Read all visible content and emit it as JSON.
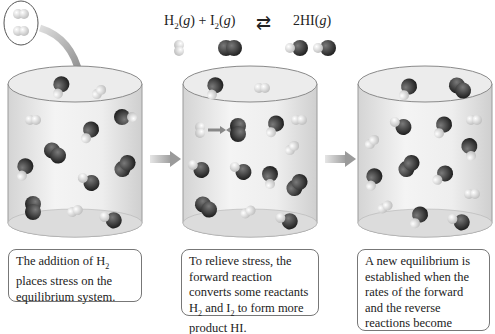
{
  "equation": {
    "reactant1": "H",
    "reactant1_sub": "2",
    "reactant1_state": "(g)",
    "plus": "+",
    "reactant2": "I",
    "reactant2_sub": "2",
    "reactant2_state": "(g)",
    "arrow": "⇄",
    "product": "2HI",
    "product_state": "(g)"
  },
  "panels": [
    {
      "caption_parts": [
        "The addition of H",
        "2",
        " places stress on the equilibrium system."
      ]
    },
    {
      "caption_parts": [
        "To relieve stress, the forward reaction converts some reactants H",
        "2",
        " and I",
        "2",
        " to form more product HI."
      ]
    },
    {
      "caption_parts": [
        "A new equilibrium is established when the rates of the forward and the reverse reactions become equal."
      ]
    }
  ],
  "colors": {
    "cylinder_fill": "#ebebeb",
    "cylinder_edge": "#9a9a9a",
    "h2_light": "#e0e0e0",
    "i2_dark": "#3a3a3a",
    "arrow_gray": "#aaaaaa"
  }
}
